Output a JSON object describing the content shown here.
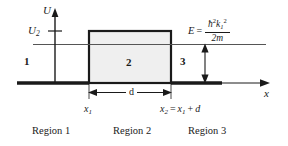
{
  "figure": {
    "axes": {
      "y_label": "U",
      "x_label": "x",
      "y_tick_label": "U",
      "y_tick_sub": "2"
    },
    "barrier": {
      "fill_color": "#eeeeee",
      "border_color": "#1a1a1a",
      "width_label": "d"
    },
    "energy": {
      "lhs": "E",
      "equals": "=",
      "numerator_hbar": "ħ",
      "numerator_hbar_exp": "2",
      "numerator_k": "k",
      "numerator_k_sub": "1",
      "numerator_k_exp": "2",
      "denominator": "2m"
    },
    "region_numbers": [
      {
        "label": "1"
      },
      {
        "label": "2"
      },
      {
        "label": "3"
      }
    ],
    "tick_labels": [
      {
        "symbol": "x",
        "sub": "1",
        "suffix": ""
      },
      {
        "symbol": "x",
        "sub": "2",
        "suffix": " = x₁ + d"
      }
    ],
    "x2_expr": {
      "lead_symbol": "x",
      "lead_sub": "2",
      "equals": "=",
      "term_symbol": "x",
      "term_sub": "1",
      "plus": "+",
      "term_d": "d"
    },
    "captions": [
      {
        "label": "Region 1"
      },
      {
        "label": "Region 2"
      },
      {
        "label": "Region 3"
      }
    ],
    "colors": {
      "line": "#1a1a1a",
      "thin_line": "#555555",
      "barrier_fill": "#efefef",
      "background": "#ffffff"
    }
  }
}
